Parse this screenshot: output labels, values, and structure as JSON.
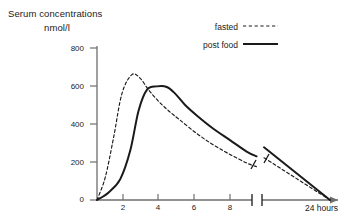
{
  "chart_data": {
    "type": "line",
    "title": "Serum concentrations",
    "subtitle": "nmol/l",
    "ylabel": "nmol/l",
    "xlabel": "24 hours",
    "ylim": [
      0,
      800
    ],
    "xlim": [
      0,
      24
    ],
    "grid": false,
    "legend_position": "top-right",
    "y_ticks": [
      "800",
      "600",
      "400",
      "200",
      "0"
    ],
    "y_tick_values": [
      800,
      600,
      400,
      200,
      0
    ],
    "x_ticks": [
      "2",
      "4",
      "6",
      "8"
    ],
    "x_tick_values": [
      2,
      4,
      6,
      8
    ],
    "axis_break": {
      "present": true,
      "after_hours": 9.6,
      "resume_hours": 10.6,
      "note": "x-axis broken between ~10 h and 24 h"
    },
    "series": [
      {
        "name": "fasted",
        "style": "dashed",
        "color": "#1a1a1a",
        "x": [
          0,
          0.5,
          1.0,
          1.5,
          2.1,
          2.6,
          3.1,
          3.7,
          4.3,
          5.0,
          6.0,
          7.0,
          8.0,
          9.0,
          9.6,
          24
        ],
        "y": [
          0,
          120,
          330,
          560,
          660,
          640,
          580,
          520,
          470,
          420,
          350,
          290,
          240,
          195,
          175,
          0
        ]
      },
      {
        "name": "post food",
        "style": "solid",
        "color": "#1a1a1a",
        "x": [
          0,
          0.7,
          1.4,
          2.0,
          2.5,
          3.0,
          3.6,
          4.2,
          4.7,
          5.3,
          6.0,
          7.0,
          8.0,
          9.0,
          9.6,
          24
        ],
        "y": [
          0,
          40,
          110,
          260,
          470,
          580,
          598,
          595,
          560,
          500,
          445,
          375,
          315,
          255,
          230,
          0
        ]
      }
    ]
  },
  "legend": {
    "items": [
      {
        "label": "fasted",
        "style": "dashed"
      },
      {
        "label": "post food",
        "style": "solid"
      }
    ]
  }
}
